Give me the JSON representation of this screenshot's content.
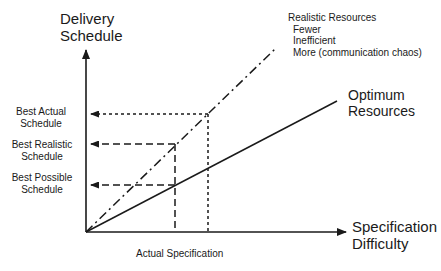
{
  "y_axis": {
    "title_line1": "Delivery",
    "title_line2": "Schedule"
  },
  "x_axis": {
    "title_line1": "Specification",
    "title_line2": "Difficulty"
  },
  "schedule_labels": [
    {
      "line1": "Best Actual",
      "line2": "Schedule"
    },
    {
      "line1": "Best Realistic",
      "line2": "Schedule"
    },
    {
      "line1": "Best Possible",
      "line2": "Schedule"
    }
  ],
  "spec_label": "Actual Specification",
  "realistic": {
    "title": "Realistic Resources",
    "items": [
      "Fewer",
      "Inefficient",
      "More (communication chaos)"
    ]
  },
  "optimum": {
    "line1": "Optimum",
    "line2": "Resources"
  },
  "colors": {
    "ink": "#1a1a1a",
    "background": "#ffffff"
  }
}
